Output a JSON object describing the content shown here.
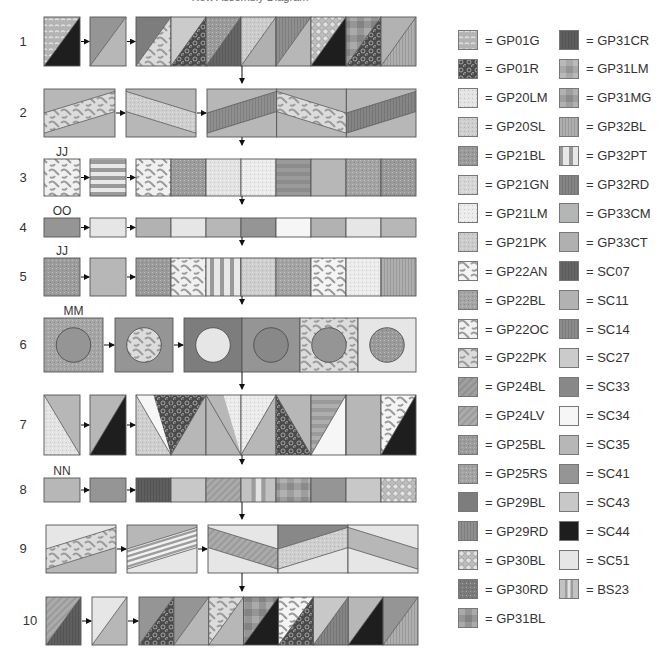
{
  "title": "Row Assembly Diagram",
  "colors": {
    "GP01G": "#b3b3b3",
    "GP01R": "#4a4a4a",
    "GP20LM": "#e4e4e4",
    "GP20SL": "#cfcfcf",
    "GP21BL": "#9a9a9a",
    "GP21GN": "#d6d6d6",
    "GP21LM": "#ececec",
    "GP21PK": "#cccccc",
    "GP22AN": "#f4f4f4",
    "GP22BL": "#a5a5a5",
    "GP22OC": "#f0f0f0",
    "GP22PK": "#dcdcdc",
    "GP24BL": "#a0a0a0",
    "GP24LV": "#ababab",
    "GP25BL": "#9c9c9c",
    "GP25RS": "#a3a3a3",
    "GP29BL": "#7d7d7d",
    "GP29RD": "#8f8f8f",
    "GP30BL": "#bdbdbd",
    "GP30RD": "#7a7a7a",
    "GP31BL": "#959595",
    "GP31CR": "#5f5f5f",
    "GP31LM": "#a8a8a8",
    "GP31MG": "#9e9e9e",
    "GP32BL": "#aeaeae",
    "GP32PT": "#e8e8e8",
    "GP32RD": "#858585",
    "GP33CM": "#b5b5b5",
    "GP33CT": "#b0b0b0",
    "SC07": "#666666",
    "SC11": "#b2b2b2",
    "SC14": "#8c8c8c",
    "SC27": "#cbcbcb",
    "SC33": "#888888",
    "SC34": "#f6f6f6",
    "SC35": "#b7b7b7",
    "SC41": "#959595",
    "SC43": "#c8c8c8",
    "SC44": "#1e1e1e",
    "SC51": "#e6e6e6",
    "BS23": "#c2c2c2"
  },
  "legend": {
    "columns": [
      [
        {
          "code": "GP01G",
          "label": "= GP01G",
          "pattern": "dots"
        },
        {
          "code": "GP01R",
          "label": "= GP01R",
          "pattern": "rings"
        },
        {
          "code": "GP20LM",
          "label": "= GP20LM",
          "pattern": "speckle"
        },
        {
          "code": "GP20SL",
          "label": "= GP20SL",
          "pattern": "speckle"
        },
        {
          "code": "GP21BL",
          "label": "= GP21BL",
          "pattern": "speckle"
        },
        {
          "code": "GP21GN",
          "label": "= GP21GN",
          "pattern": "speckle"
        },
        {
          "code": "GP21LM",
          "label": "= GP21LM",
          "pattern": "speckle"
        },
        {
          "code": "GP21PK",
          "label": "= GP21PK",
          "pattern": "speckle"
        },
        {
          "code": "GP22AN",
          "label": "= GP22AN",
          "pattern": "vines"
        },
        {
          "code": "GP22BL",
          "label": "= GP22BL",
          "pattern": "speckle"
        },
        {
          "code": "GP22OC",
          "label": "= GP22OC",
          "pattern": "vines"
        },
        {
          "code": "GP22PK",
          "label": "= GP22PK",
          "pattern": "vines"
        },
        {
          "code": "GP24BL",
          "label": "= GP24BL",
          "pattern": "diag"
        },
        {
          "code": "GP24LV",
          "label": "= GP24LV",
          "pattern": "diag"
        },
        {
          "code": "GP25BL",
          "label": "= GP25BL",
          "pattern": "speckle"
        },
        {
          "code": "GP25RS",
          "label": "= GP25RS",
          "pattern": "speckle"
        },
        {
          "code": "GP29BL",
          "label": "= GP29BL",
          "pattern": "solid"
        },
        {
          "code": "GP29RD",
          "label": "= GP29RD",
          "pattern": "vstripe"
        },
        {
          "code": "GP30BL",
          "label": "= GP30BL",
          "pattern": "pebble"
        },
        {
          "code": "GP30RD",
          "label": "= GP30RD",
          "pattern": "speckle"
        },
        {
          "code": "GP31BL",
          "label": "= GP31BL",
          "pattern": "blocks"
        }
      ],
      [
        {
          "code": "GP31CR",
          "label": "= GP31CR",
          "pattern": "vstripe"
        },
        {
          "code": "GP31LM",
          "label": "= GP31LM",
          "pattern": "blocks"
        },
        {
          "code": "GP31MG",
          "label": "= GP31MG",
          "pattern": "blocks"
        },
        {
          "code": "GP32BL",
          "label": "= GP32BL",
          "pattern": "vstripe"
        },
        {
          "code": "GP32PT",
          "label": "= GP32PT",
          "pattern": "wide-vstripe"
        },
        {
          "code": "GP32RD",
          "label": "= GP32RD",
          "pattern": "vstripe"
        },
        {
          "code": "GP33CM",
          "label": "= GP33CM",
          "pattern": "solid"
        },
        {
          "code": "GP33CT",
          "label": "= GP33CT",
          "pattern": "solid"
        },
        {
          "code": "SC07",
          "label": "= SC07",
          "pattern": "vstripe"
        },
        {
          "code": "SC11",
          "label": "= SC11",
          "pattern": "solid"
        },
        {
          "code": "SC14",
          "label": "= SC14",
          "pattern": "vstripe"
        },
        {
          "code": "SC27",
          "label": "= SC27",
          "pattern": "solid"
        },
        {
          "code": "SC33",
          "label": "= SC33",
          "pattern": "solid"
        },
        {
          "code": "SC34",
          "label": "= SC34",
          "pattern": "solid"
        },
        {
          "code": "SC35",
          "label": "= SC35",
          "pattern": "solid"
        },
        {
          "code": "SC41",
          "label": "= SC41",
          "pattern": "solid"
        },
        {
          "code": "SC43",
          "label": "= SC43",
          "pattern": "solid"
        },
        {
          "code": "SC44",
          "label": "= SC44",
          "pattern": "solid"
        },
        {
          "code": "SC51",
          "label": "= SC51",
          "pattern": "solid"
        },
        {
          "code": "BS23",
          "label": "= BS23",
          "pattern": "bs23"
        }
      ]
    ]
  },
  "rows": [
    {
      "number": "1",
      "unit_label": "",
      "y": 17,
      "h": 49,
      "type": "hst",
      "unit": {
        "x": 44,
        "w": 36,
        "a": "GP01G",
        "b": "SC44"
      },
      "pair": {
        "x": 90,
        "w": 36,
        "a": "SC41",
        "b": "SC35"
      },
      "strip": {
        "x": 136,
        "w": 280,
        "blocks": [
          {
            "a": "GP29BL",
            "b": "GP22PK"
          },
          {
            "a": "SC27",
            "b": "GP01R"
          },
          {
            "a": "GP21BL",
            "b": "SC07"
          },
          {
            "a": "GP21PK",
            "b": "GP33CT"
          },
          {
            "a": "GP29RD",
            "b": "SC35"
          },
          {
            "a": "GP30BL",
            "b": "SC44"
          },
          {
            "a": "GP31BL",
            "b": "GP01R"
          },
          {
            "a": "SC11",
            "b": "GP32BL"
          }
        ]
      }
    },
    {
      "number": "2",
      "unit_label": "",
      "y": 89,
      "h": 48,
      "type": "band",
      "unit": {
        "x": 44,
        "w": 71,
        "bg": "SC35",
        "band": "GP22PK",
        "dir": "up"
      },
      "pair": {
        "x": 126,
        "w": 70,
        "bg": "SC35",
        "band": "GP20SL",
        "dir": "down"
      },
      "strip": {
        "x": 207,
        "w": 209,
        "blocks": [
          {
            "bg": "SC35",
            "band": "GP29RD",
            "dir": "up"
          },
          {
            "bg": "SC35",
            "band": "GP22PK",
            "dir": "down"
          },
          {
            "bg": "SC35",
            "band": "GP32RD",
            "dir": "up"
          }
        ]
      }
    },
    {
      "number": "3",
      "unit_label": "JJ",
      "y": 159,
      "h": 37,
      "type": "square",
      "unit": {
        "x": 44,
        "w": 36,
        "c": "GP22OC"
      },
      "pair": {
        "x": 90,
        "w": 36,
        "c": "GP32PT",
        "pattern": "hstripe"
      },
      "strip": {
        "x": 136,
        "w": 280,
        "blocks": [
          {
            "c": "GP22OC"
          },
          {
            "c": "GP25BL"
          },
          {
            "c": "GP20LM"
          },
          {
            "c": "GP21LM"
          },
          {
            "c": "SC14",
            "pattern": "hstripe"
          },
          {
            "c": "SC35"
          },
          {
            "c": "GP25RS"
          },
          {
            "c": "GP21BL"
          }
        ]
      }
    },
    {
      "number": "4",
      "unit_label": "OO",
      "y": 218,
      "h": 19,
      "type": "square",
      "unit": {
        "x": 44,
        "w": 36,
        "c": "SC41"
      },
      "pair": {
        "x": 90,
        "w": 36,
        "c": "SC51"
      },
      "strip": {
        "x": 136,
        "w": 280,
        "blocks": [
          {
            "c": "SC11"
          },
          {
            "c": "SC51"
          },
          {
            "c": "SC35"
          },
          {
            "c": "SC41"
          },
          {
            "c": "SC34"
          },
          {
            "c": "SC11"
          },
          {
            "c": "SC51"
          },
          {
            "c": "SC35"
          }
        ]
      }
    },
    {
      "number": "5",
      "unit_label": "JJ",
      "y": 258,
      "h": 38,
      "type": "square",
      "unit": {
        "x": 44,
        "w": 36,
        "c": "GP25BL"
      },
      "pair": {
        "x": 90,
        "w": 36,
        "c": "SC35"
      },
      "strip": {
        "x": 136,
        "w": 280,
        "blocks": [
          {
            "c": "GP21BL"
          },
          {
            "c": "GP22OC"
          },
          {
            "c": "GP32PT",
            "pattern": "vstripe-wide"
          },
          {
            "c": "GP20SL"
          },
          {
            "c": "GP25RS"
          },
          {
            "c": "GP22AN"
          },
          {
            "c": "GP21LM"
          },
          {
            "c": "GP32BL",
            "pattern": "vstripe"
          }
        ]
      }
    },
    {
      "number": "6",
      "unit_label": "MM",
      "y": 318,
      "h": 54,
      "type": "circle",
      "unit": {
        "x": 44,
        "w": 59,
        "bg": "GP22BL",
        "circle": "SC41"
      },
      "pair": {
        "x": 115,
        "w": 58,
        "bg": "SC41",
        "circle": "GP22PK"
      },
      "strip": {
        "x": 184,
        "w": 232,
        "blocks": [
          {
            "bg": "GP29BL",
            "circle": "SC51"
          },
          {
            "bg": "SC41",
            "circle": "SC33"
          },
          {
            "bg": "GP22PK",
            "circle": "SC41"
          },
          {
            "bg": "SC51",
            "circle": "GP21BL"
          }
        ]
      }
    },
    {
      "number": "7",
      "unit_label": "",
      "y": 395,
      "h": 60,
      "type": "tri",
      "unit": {
        "x": 44,
        "w": 36,
        "kind": "hst-r",
        "a": "SC35",
        "b": "GP20LM"
      },
      "pair": {
        "x": 90,
        "w": 36,
        "kind": "hst",
        "a": "SC35",
        "b": "SC44"
      },
      "strip": {
        "x": 136,
        "w": 280,
        "blocks": [
          {
            "kind": "vtri-down",
            "top": "SC34",
            "left": "GP20SL",
            "right": "GP01R",
            "apex": "right"
          },
          {
            "kind": "vtri-up-half",
            "bg": "SC35",
            "tri": "SC35",
            "left": "GP01R"
          },
          {
            "kind": "vtri-down",
            "top": "SC35",
            "left": "SC35",
            "right": "GP21LM",
            "apex": "right"
          },
          {
            "kind": "vtri-up-half",
            "bg": "SC35",
            "tri": "SC35",
            "left": "GP21LM"
          },
          {
            "kind": "vtri-down",
            "top": "SC35",
            "left": "GP01R",
            "right": "SC35",
            "apex": "right"
          },
          {
            "kind": "vtri-up-half",
            "bg": "GP32BL",
            "tri": "SC34",
            "left": "GP32BL",
            "stripe": true
          },
          {
            "kind": "vtri-down",
            "top": "SC35",
            "left": "GP20SL",
            "right": "SC35",
            "apex": "left"
          },
          {
            "kind": "hst",
            "a": "GP22AN",
            "b": "SC44"
          }
        ]
      }
    },
    {
      "number": "8",
      "unit_label": "NN",
      "y": 478,
      "h": 24,
      "type": "square",
      "unit": {
        "x": 44,
        "w": 36,
        "c": "SC35"
      },
      "pair": {
        "x": 90,
        "w": 36,
        "c": "SC41"
      },
      "strip": {
        "x": 136,
        "w": 280,
        "blocks": [
          {
            "c": "GP31CR",
            "pattern": "vstripe"
          },
          {
            "c": "SC43"
          },
          {
            "c": "GP24LV",
            "pattern": "diag"
          },
          {
            "c": "BS23",
            "pattern": "bs23"
          },
          {
            "c": "GP31MG",
            "pattern": "blocks"
          },
          {
            "c": "SC41"
          },
          {
            "c": "SC43"
          },
          {
            "c": "GP30BL"
          }
        ]
      }
    },
    {
      "number": "9",
      "unit_label": "",
      "y": 525,
      "h": 48,
      "type": "band",
      "unit": {
        "x": 46,
        "w": 70,
        "bg": "SC51",
        "bg2": "SC35",
        "band": "GP22PK",
        "dir": "up"
      },
      "pair": {
        "x": 127,
        "w": 70,
        "bg": "SC35",
        "bg2": "SC51",
        "band": "GP32PT",
        "dir": "up",
        "striped": true
      },
      "strip": {
        "x": 208,
        "w": 210,
        "blocks": [
          {
            "bg": "SC51",
            "band": "GP24LV",
            "dir": "down"
          },
          {
            "bg": "SC33",
            "bg2": "SC51",
            "band": "GP20SL",
            "dir": "up"
          },
          {
            "bg": "SC51",
            "band": "SC35",
            "dir": "down"
          }
        ]
      }
    },
    {
      "number": "10",
      "unit_label": "",
      "y": 597,
      "h": 48,
      "type": "hst",
      "unit": {
        "x": 46,
        "w": 35,
        "a": "GP24LV",
        "b": "GP31CR"
      },
      "pair": {
        "x": 92,
        "w": 35,
        "a": "SC51",
        "b": "SC35"
      },
      "strip": {
        "x": 139,
        "w": 279,
        "blocks": [
          {
            "a": "SC41",
            "b": "GP01R"
          },
          {
            "a": "SC41",
            "b": "SC35"
          },
          {
            "a": "GP22PK",
            "b": "SC35"
          },
          {
            "a": "GP31BL",
            "b": "SC44"
          },
          {
            "a": "GP22AN",
            "b": "GP01R"
          },
          {
            "a": "SC43",
            "b": "GP32RD"
          },
          {
            "a": "SC35",
            "b": "SC44"
          },
          {
            "a": "SC41",
            "b": "GP32BL"
          }
        ]
      }
    }
  ]
}
